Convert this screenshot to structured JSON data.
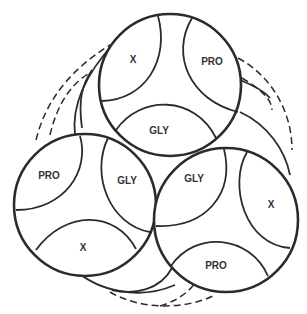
{
  "diagram": {
    "type": "collagen triple-helix cross-section (three stacked circles)",
    "stroke_color": "#2b2b2b",
    "background": "#ffffff",
    "circles": [
      {
        "id": "top",
        "segments": [
          {
            "label": "X",
            "position": "upper-left"
          },
          {
            "label": "PRO",
            "position": "upper-right"
          },
          {
            "label": "GLY",
            "position": "bottom"
          }
        ]
      },
      {
        "id": "left",
        "segments": [
          {
            "label": "PRO",
            "position": "upper-left"
          },
          {
            "label": "GLY",
            "position": "upper-right"
          },
          {
            "label": "X",
            "position": "bottom"
          }
        ]
      },
      {
        "id": "right",
        "segments": [
          {
            "label": "GLY",
            "position": "upper-left"
          },
          {
            "label": "X",
            "position": "right"
          },
          {
            "label": "PRO",
            "position": "bottom"
          }
        ]
      }
    ],
    "background_layers": {
      "solid_offset_circles": 2,
      "dashed_offset_circles": 1
    }
  }
}
